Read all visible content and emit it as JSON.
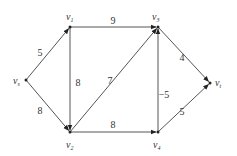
{
  "graph": {
    "nodes": [
      {
        "id": "vs",
        "name": "v",
        "sub": "s"
      },
      {
        "id": "v1",
        "name": "v",
        "sub": "1"
      },
      {
        "id": "v2",
        "name": "v",
        "sub": "2"
      },
      {
        "id": "v3",
        "name": "v",
        "sub": "3"
      },
      {
        "id": "v4",
        "name": "v",
        "sub": "4"
      },
      {
        "id": "vt",
        "name": "v",
        "sub": "t"
      }
    ],
    "edges": [
      {
        "from": "vs",
        "to": "v1",
        "weight": "5"
      },
      {
        "from": "vs",
        "to": "v2",
        "weight": "8"
      },
      {
        "from": "v1",
        "to": "v3",
        "weight": "9"
      },
      {
        "from": "v1",
        "to": "v2",
        "weight": "8"
      },
      {
        "from": "v2",
        "to": "v3",
        "weight": "7"
      },
      {
        "from": "v2",
        "to": "v4",
        "weight": "8"
      },
      {
        "from": "v4",
        "to": "v3",
        "weight": "-5"
      },
      {
        "from": "v3",
        "to": "vt",
        "weight": "4"
      },
      {
        "from": "v4",
        "to": "vt",
        "weight": "5"
      }
    ]
  }
}
